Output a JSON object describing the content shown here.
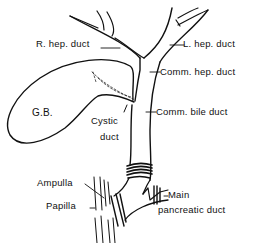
{
  "diagram": {
    "title": "",
    "labels": {
      "r_hep_duct": "R. hep. duct",
      "l_hep_duct": "L. hep. duct",
      "comm_hep_duct": "Comm. hep. duct",
      "comm_bile_duct": "Comm. bile duct",
      "gb": "G.B.",
      "cystic_duct_line1": "Cystic",
      "cystic_duct_line2": "duct",
      "ampulla": "Ampulla",
      "papilla": "Papilla",
      "main_line1": "Main",
      "main_line2": "pancreatic duct"
    },
    "colors": {
      "ink": "#111111",
      "background": "#ffffff"
    }
  }
}
